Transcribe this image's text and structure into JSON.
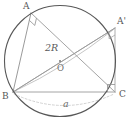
{
  "figure": {
    "canvas": {
      "width": 132,
      "height": 123,
      "background": "#ffffff"
    },
    "circle": {
      "name": "circumcircle",
      "cx": 60,
      "cy": 61,
      "r": 55.5,
      "stroke": "#585858",
      "stroke_width": 1.1
    },
    "center_point": {
      "label": "O",
      "x": 60,
      "y": 61,
      "dot_radius": 0.9,
      "label_x": 57,
      "label_y": 64,
      "color": "#6a6a6a"
    },
    "vertices": [
      {
        "key": "A",
        "label": "A",
        "x": 31,
        "y": 13,
        "label_x": 23,
        "label_y": 2,
        "color": "#555555"
      },
      {
        "key": "Ap",
        "label": "A'",
        "x": 115,
        "y": 28,
        "label_x": 117,
        "label_y": 17,
        "color": "#555555"
      },
      {
        "key": "B",
        "label": "B",
        "x": 13,
        "y": 92,
        "label_x": 2,
        "label_y": 92,
        "color": "#555555"
      },
      {
        "key": "C",
        "label": "C",
        "x": 115,
        "y": 92,
        "label_x": 119,
        "label_y": 90,
        "color": "#555555"
      }
    ],
    "segments": [
      {
        "name": "side-AB",
        "from": "A",
        "to": "B",
        "stroke": "#8f8f8f",
        "stroke_width": 0.9,
        "dash": ""
      },
      {
        "name": "side-AC",
        "from": "A",
        "to": "C",
        "stroke": "#9a9a9a",
        "stroke_width": 0.9,
        "dash": ""
      },
      {
        "name": "side-BC",
        "from": "B",
        "to": "C",
        "stroke": "#9a9a9a",
        "stroke_width": 0.9,
        "dash": ""
      },
      {
        "name": "side-A-prime-B",
        "from": "Ap",
        "to": "B",
        "stroke": "#a5a5a5",
        "stroke_width": 0.9,
        "dash": ""
      },
      {
        "name": "side-A-prime-C",
        "from": "Ap",
        "to": "C",
        "stroke": "#a5a5a5",
        "stroke_width": 0.9,
        "dash": ""
      },
      {
        "name": "diameter-B-A-prime",
        "from": "B",
        "to": "Ap",
        "stroke": "#9a9a9a",
        "stroke_width": 0.9,
        "dash": ""
      }
    ],
    "right_angle_marks": [
      {
        "name": "right-angle-at-A",
        "vertex": "A",
        "p1": "B",
        "p2": "C",
        "size": 7.5,
        "stroke": "#8f8f8f"
      },
      {
        "name": "right-angle-at-C",
        "vertex": "C",
        "p1": "B",
        "p2": "Ap",
        "size": 7.5,
        "stroke": "#8f8f8f"
      },
      {
        "name": "right-angle-at-A-prime",
        "vertex": "Ap",
        "p1": "B",
        "p2": "C",
        "size": 7.0,
        "stroke": "#a5a5a5"
      }
    ],
    "arcs": [
      {
        "name": "chord-arc-B-to-A-prime",
        "d": "M 15 91 Q 64 68 113 30",
        "stroke": "#b8b8b8",
        "stroke_width": 0.8,
        "dash": ""
      },
      {
        "name": "measure-arc-a-below-BC",
        "d": "M 14 94 Q 64 117 114 94",
        "stroke": "#c4c4c4",
        "stroke_width": 0.8,
        "dash": "2,2"
      }
    ],
    "measure_labels": [
      {
        "name": "diameter-label",
        "text": "2R",
        "x": 45,
        "y": 43,
        "color": "#5a5a5a",
        "value": "2R",
        "meaning": "diameter of the circumcircle"
      },
      {
        "name": "side-a-label",
        "text": "a",
        "x": 63,
        "y": 99,
        "color": "#6a6a6a",
        "value": "a",
        "meaning": "length of side BC"
      }
    ]
  }
}
